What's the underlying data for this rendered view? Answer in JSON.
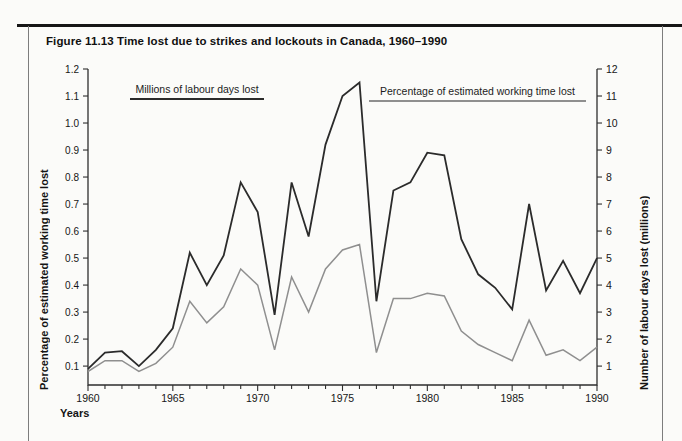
{
  "figure": {
    "title": "Figure 11.13 Time lost due to strikes and lockouts in Canada, 1960–1990"
  },
  "chart_data": {
    "type": "line",
    "title": "Figure 11.13 Time lost due to strikes and lockouts in Canada, 1960–1990",
    "xlabel": "Years",
    "grid": false,
    "legend_position": "top-inside",
    "x": [
      1960,
      1961,
      1962,
      1963,
      1964,
      1965,
      1966,
      1967,
      1968,
      1969,
      1970,
      1971,
      1972,
      1973,
      1974,
      1975,
      1976,
      1977,
      1978,
      1979,
      1980,
      1981,
      1982,
      1983,
      1984,
      1985,
      1986,
      1987,
      1988,
      1989,
      1990
    ],
    "x_tick_labels": [
      "1960",
      "1965",
      "1970",
      "1975",
      "1980",
      "1985",
      "1990"
    ],
    "axes": {
      "x": {
        "min": 1960,
        "max": 1990,
        "minor_tick_step": 1,
        "label_step": 5
      },
      "left": {
        "label": "Percentage of estimated working time lost",
        "min": 0.03,
        "max": 1.2,
        "ticks": [
          "0.1",
          "0.2",
          "0.3",
          "0.4",
          "0.5",
          "0.6",
          "0.7",
          "0.8",
          "0.9",
          "1.0",
          "1.1",
          "1.2"
        ]
      },
      "right": {
        "label": "Number of labour days lost (millions)",
        "min": 0.3,
        "max": 12,
        "ticks": [
          "1",
          "2",
          "3",
          "4",
          "5",
          "6",
          "7",
          "8",
          "9",
          "10",
          "11",
          "12"
        ]
      }
    },
    "series": [
      {
        "name": "Millions of labour days lost",
        "axis": "right",
        "color": "#2b2b2b",
        "line_width": 1.8,
        "values": [
          0.9,
          1.5,
          1.55,
          1.0,
          1.6,
          2.4,
          5.2,
          4.0,
          5.1,
          7.8,
          6.7,
          2.9,
          7.8,
          5.8,
          9.2,
          11.0,
          11.5,
          3.4,
          7.5,
          7.8,
          8.9,
          8.8,
          5.7,
          4.4,
          3.9,
          3.1,
          7.0,
          3.8,
          4.9,
          3.7,
          5.0
        ]
      },
      {
        "name": "Percentage of estimated working time lost",
        "axis": "left",
        "color": "#8f8f8f",
        "line_width": 1.5,
        "values": [
          0.08,
          0.12,
          0.12,
          0.08,
          0.11,
          0.17,
          0.34,
          0.26,
          0.32,
          0.46,
          0.4,
          0.16,
          0.43,
          0.3,
          0.46,
          0.53,
          0.55,
          0.15,
          0.35,
          0.35,
          0.37,
          0.36,
          0.23,
          0.18,
          0.15,
          0.12,
          0.27,
          0.14,
          0.16,
          0.12,
          0.17
        ]
      }
    ]
  }
}
